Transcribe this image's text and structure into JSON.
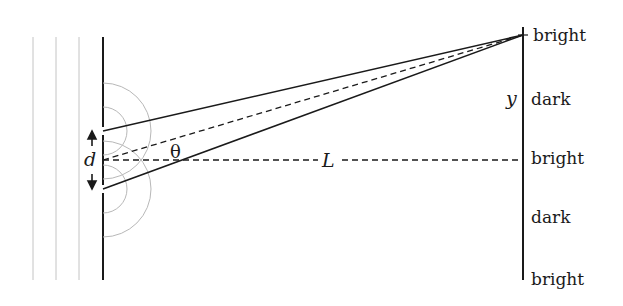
{
  "diagram": {
    "labels": {
      "slit_separation": "d",
      "angle": "θ",
      "distance": "L",
      "position": "y"
    },
    "screen_fringes": [
      "bright",
      "dark",
      "bright",
      "dark",
      "bright"
    ],
    "colors": {
      "line": "#1a1a1a",
      "wave": "#b8b8b8"
    }
  }
}
